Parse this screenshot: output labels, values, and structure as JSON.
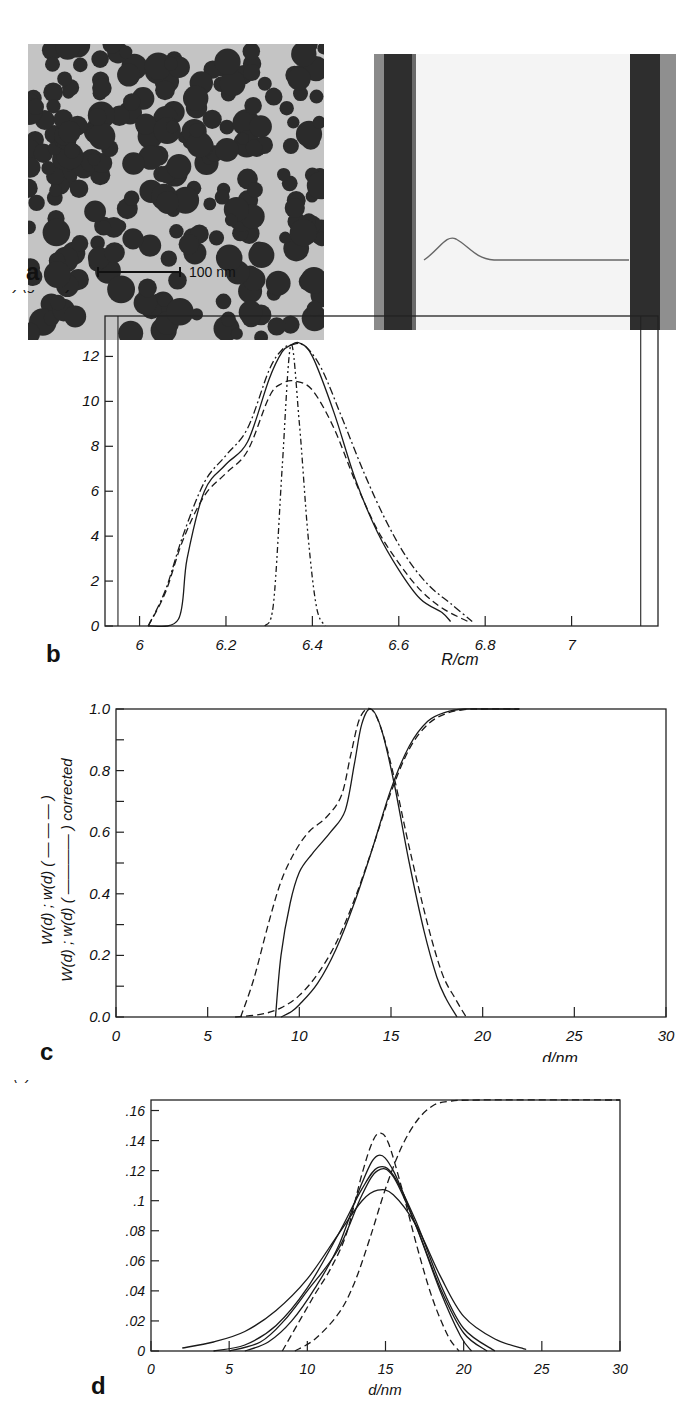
{
  "figure": {
    "panels": [
      {
        "id": "a",
        "label": "a",
        "scale_bar_label": "100 nm",
        "images": [
          "electron-micrograph",
          "ultracentrifuge-schlieren-image"
        ]
      },
      {
        "id": "b",
        "label": "b"
      },
      {
        "id": "c",
        "label": "c"
      },
      {
        "id": "d",
        "label": "d"
      }
    ]
  },
  "chart_data": [
    {
      "panel": "b",
      "type": "line",
      "title": "",
      "xlabel": "R/cm",
      "ylabel": "1000 (dC/dR)/(g/cm⁴)",
      "xlim": [
        5.92,
        7.2
      ],
      "ylim": [
        0,
        13.8
      ],
      "xticks": [
        6,
        6.2,
        6.4,
        6.6,
        6.8,
        7
      ],
      "xtick_labels": [
        "6",
        "6.2",
        "6.4",
        "6.6",
        "6.8",
        "7"
      ],
      "yticks": [
        0,
        2,
        4,
        6,
        8,
        10,
        12
      ],
      "ytick_labels": [
        "0",
        "2",
        "4",
        "6",
        "8",
        "10",
        "12"
      ],
      "grid": false,
      "legend": null,
      "meniscus_lines_x": [
        5.95,
        7.16
      ],
      "series": [
        {
          "name": "solid",
          "style": "solid",
          "x": [
            6.02,
            6.09,
            6.11,
            6.15,
            6.2,
            6.25,
            6.3,
            6.33,
            6.35,
            6.37,
            6.4,
            6.45,
            6.5,
            6.55,
            6.6,
            6.65,
            6.7,
            6.72
          ],
          "y": [
            0,
            0.3,
            3.0,
            6.0,
            7.2,
            8.2,
            11.0,
            12.2,
            12.5,
            12.6,
            12.0,
            9.5,
            6.5,
            4.2,
            2.5,
            1.2,
            0.6,
            0.2
          ]
        },
        {
          "name": "dashed",
          "style": "dashed",
          "x": [
            6.02,
            6.06,
            6.1,
            6.15,
            6.2,
            6.25,
            6.3,
            6.33,
            6.36,
            6.4,
            6.45,
            6.5,
            6.55,
            6.6,
            6.65,
            6.7,
            6.76
          ],
          "y": [
            0,
            1.5,
            3.8,
            5.8,
            6.8,
            7.8,
            10.2,
            10.8,
            10.9,
            10.5,
            8.8,
            6.4,
            4.3,
            2.8,
            1.6,
            0.8,
            0.2
          ]
        },
        {
          "name": "dash-dot",
          "style": "dash-dot",
          "x": [
            6.02,
            6.06,
            6.1,
            6.15,
            6.2,
            6.25,
            6.3,
            6.33,
            6.35,
            6.38,
            6.42,
            6.47,
            6.52,
            6.57,
            6.62,
            6.67,
            6.72,
            6.77
          ],
          "y": [
            0,
            1.6,
            4.0,
            6.4,
            7.6,
            8.8,
            11.4,
            12.3,
            12.5,
            12.5,
            11.5,
            9.2,
            6.8,
            4.7,
            3.0,
            1.8,
            1.0,
            0.2
          ]
        },
        {
          "name": "dash-dot-dot (narrow)",
          "style": "dash-dot-dot",
          "x": [
            6.29,
            6.31,
            6.33,
            6.35,
            6.37,
            6.39,
            6.41,
            6.43
          ],
          "y": [
            0,
            1.0,
            7.0,
            12.5,
            9.0,
            4.0,
            0.8,
            0
          ]
        }
      ]
    },
    {
      "panel": "c",
      "type": "line",
      "title": "",
      "xlabel": "d/nm",
      "ylabel": "W(d) ; w(d) (- - - -)  W(d) ; w(d) (——) corrected",
      "xlim": [
        0,
        30
      ],
      "ylim": [
        0,
        1.0
      ],
      "xticks": [
        0,
        5,
        10,
        15,
        20,
        25,
        30
      ],
      "xtick_labels": [
        "0",
        "5",
        "10",
        "15",
        "20",
        "25",
        "30"
      ],
      "yticks": [
        0,
        0.2,
        0.4,
        0.6,
        0.8,
        1.0
      ],
      "ytick_labels": [
        "0.0",
        "0.2",
        "0.4",
        "0.6",
        "0.8",
        "1.0"
      ],
      "grid": false,
      "legend": null,
      "series": [
        {
          "name": "w(d)",
          "style": "dashed",
          "x": [
            6.8,
            7.5,
            8.3,
            9.0,
            9.7,
            10.5,
            11.5,
            12.3,
            12.8,
            13.3,
            13.9,
            14.5,
            15.2,
            16.0,
            17.0,
            17.8,
            18.5,
            19.1
          ],
          "y": [
            0,
            0.12,
            0.3,
            0.44,
            0.53,
            0.6,
            0.65,
            0.72,
            0.85,
            0.97,
            1.0,
            0.93,
            0.77,
            0.55,
            0.3,
            0.14,
            0.06,
            0
          ]
        },
        {
          "name": "w(d) corrected",
          "style": "solid",
          "x": [
            8.7,
            9.0,
            9.5,
            10.0,
            10.7,
            11.7,
            12.5,
            13.0,
            13.4,
            13.9,
            14.5,
            15.2,
            16.0,
            16.8,
            17.5,
            18.0,
            18.6
          ],
          "y": [
            0,
            0.2,
            0.37,
            0.47,
            0.53,
            0.6,
            0.67,
            0.82,
            0.95,
            1.0,
            0.93,
            0.75,
            0.5,
            0.28,
            0.13,
            0.06,
            0
          ]
        },
        {
          "name": "W(d)",
          "style": "dashed",
          "x": [
            6.5,
            8.0,
            9.0,
            10.0,
            11.0,
            12.0,
            13.0,
            14.0,
            15.0,
            16.0,
            17.0,
            18.0,
            19.0,
            20.0,
            22.0
          ],
          "y": [
            0,
            0.01,
            0.03,
            0.07,
            0.14,
            0.24,
            0.38,
            0.55,
            0.73,
            0.87,
            0.95,
            0.985,
            0.998,
            1.0,
            1.0
          ]
        },
        {
          "name": "W(d) corrected",
          "style": "solid",
          "x": [
            9.0,
            9.5,
            10.0,
            11.0,
            12.0,
            13.0,
            14.0,
            15.0,
            16.0,
            17.0,
            18.0,
            19.0,
            20.0,
            22.0
          ],
          "y": [
            0,
            0.015,
            0.04,
            0.11,
            0.22,
            0.37,
            0.55,
            0.74,
            0.88,
            0.96,
            0.99,
            1.0,
            1.0,
            1.0
          ]
        }
      ]
    },
    {
      "panel": "d",
      "type": "line",
      "title": "",
      "xlabel": "d/nm",
      "ylabel": "w(d)    W(d)",
      "xlim": [
        0,
        30
      ],
      "ylim": [
        0,
        0.167
      ],
      "xticks": [
        0,
        5,
        10,
        15,
        20,
        25,
        30
      ],
      "xtick_labels": [
        "0",
        "5",
        "10",
        "15",
        "20",
        "25",
        "30"
      ],
      "yticks": [
        0,
        0.02,
        0.04,
        0.06,
        0.08,
        0.1,
        0.12,
        0.14,
        0.16
      ],
      "ytick_labels": [
        "0",
        ".02",
        ".04",
        ".06",
        ".08",
        ".1",
        ".12",
        ".14",
        ".16"
      ],
      "grid": false,
      "legend": null,
      "series": [
        {
          "name": "w(d) broad",
          "style": "solid",
          "x": [
            2.0,
            4.0,
            6.0,
            8.0,
            10.0,
            12.0,
            13.5,
            14.5,
            15.5,
            17.0,
            18.5,
            20.0,
            22.0,
            24.0
          ],
          "y": [
            0.002,
            0.006,
            0.013,
            0.027,
            0.048,
            0.078,
            0.1,
            0.107,
            0.104,
            0.083,
            0.05,
            0.023,
            0.008,
            0.001
          ]
        },
        {
          "name": "w(d) 2",
          "style": "solid",
          "x": [
            4.0,
            6.0,
            8.0,
            10.0,
            12.0,
            13.5,
            14.5,
            15.5,
            17.0,
            18.5,
            20.0,
            22.0
          ],
          "y": [
            0,
            0.004,
            0.017,
            0.042,
            0.078,
            0.108,
            0.122,
            0.117,
            0.085,
            0.045,
            0.015,
            0
          ]
        },
        {
          "name": "w(d) 3",
          "style": "solid",
          "x": [
            5.0,
            7.0,
            8.5,
            10.0,
            12.0,
            13.5,
            14.5,
            15.5,
            17.0,
            18.5,
            20.0,
            21.5
          ],
          "y": [
            0,
            0.006,
            0.02,
            0.04,
            0.068,
            0.104,
            0.12,
            0.116,
            0.082,
            0.042,
            0.012,
            0
          ]
        },
        {
          "name": "w(d) 4",
          "style": "solid",
          "x": [
            6.0,
            7.5,
            9.0,
            10.5,
            12.0,
            13.5,
            14.5,
            15.5,
            17.0,
            18.5,
            19.8,
            20.5
          ],
          "y": [
            0,
            0.006,
            0.02,
            0.042,
            0.07,
            0.112,
            0.13,
            0.12,
            0.082,
            0.04,
            0.01,
            0
          ]
        },
        {
          "name": "w(d) dashed (narrow)",
          "style": "dashed",
          "x": [
            8.4,
            9.5,
            10.5,
            11.5,
            12.5,
            13.5,
            14.2,
            14.7,
            15.2,
            16.0,
            17.0,
            18.0,
            19.0,
            19.7
          ],
          "y": [
            0,
            0.02,
            0.038,
            0.055,
            0.078,
            0.118,
            0.14,
            0.145,
            0.138,
            0.11,
            0.07,
            0.035,
            0.01,
            0
          ]
        },
        {
          "name": "W(d) cumulative (scaled)",
          "style": "dashed",
          "x": [
            9.2,
            10.5,
            12.0,
            13.0,
            14.0,
            15.0,
            16.0,
            17.0,
            18.0,
            19.0,
            21.0,
            30.0
          ],
          "y": [
            0,
            0.008,
            0.025,
            0.045,
            0.075,
            0.108,
            0.135,
            0.153,
            0.163,
            0.166,
            0.167,
            0.167
          ]
        }
      ]
    }
  ]
}
